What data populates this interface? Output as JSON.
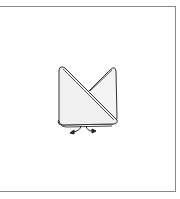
{
  "figure": {
    "colors": {
      "frame": "#8a8a8a",
      "fill": "#f2f2f2",
      "stroke": "#333333",
      "background": "#ffffff"
    },
    "annotations": [
      {
        "type": "arrow",
        "direction": "down-left",
        "meaning": "pull corner outward"
      },
      {
        "type": "arrow",
        "direction": "down-right",
        "meaning": "pull corner outward"
      }
    ]
  }
}
